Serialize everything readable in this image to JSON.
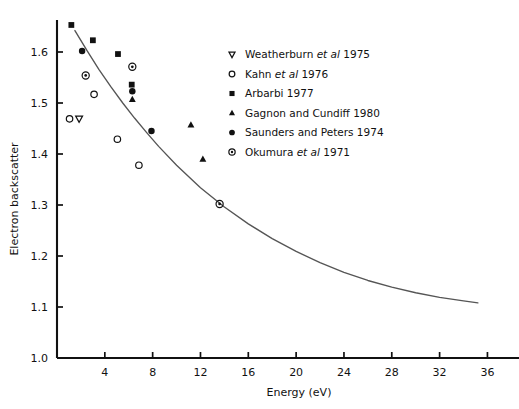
{
  "chart_data": {
    "type": "scatter",
    "title": "",
    "xlabel": "Energy (eV)",
    "ylabel": "Electron backscatter",
    "xlim": [
      0,
      36.8
    ],
    "ylim": [
      1.0,
      1.675
    ],
    "xticks": [
      4,
      8,
      12,
      16,
      20,
      24,
      28,
      32,
      36
    ],
    "yticks": [
      "1.0",
      "1.1",
      "1.2",
      "1.3",
      "1.4",
      "1.5",
      "1.6"
    ],
    "ytick_values": [
      1.0,
      1.1,
      1.2,
      1.3,
      1.4,
      1.5,
      1.6
    ],
    "grid": false,
    "legend_position": "upper-right-inside",
    "series": [
      {
        "name": "Weatherburn et al 1975",
        "marker": "triangle-down-open",
        "year": "1975",
        "points": [
          [
            1.85,
            1.469
          ]
        ]
      },
      {
        "name": "Kahn et al 1976",
        "marker": "circle-open",
        "year": "1976",
        "points": [
          [
            1.05,
            1.469
          ],
          [
            3.1,
            1.517
          ],
          [
            5.05,
            1.429
          ],
          [
            6.85,
            1.378
          ]
        ]
      },
      {
        "name": "Arbarbi 1977",
        "marker": "square-filled",
        "year": "1977",
        "points": [
          [
            1.2,
            1.653
          ],
          [
            3.0,
            1.623
          ],
          [
            5.1,
            1.596
          ],
          [
            6.25,
            1.536
          ]
        ]
      },
      {
        "name": "Gagnon and Cundiff 1980",
        "marker": "triangle-up-filled",
        "year": "1980",
        "points": [
          [
            6.3,
            1.507
          ],
          [
            11.2,
            1.457
          ],
          [
            12.2,
            1.39
          ]
        ]
      },
      {
        "name": "Saunders and Peters 1974",
        "marker": "circle-filled",
        "year": "1974",
        "points": [
          [
            2.1,
            1.602
          ],
          [
            6.3,
            1.523
          ],
          [
            7.9,
            1.445
          ]
        ]
      },
      {
        "name": "Okumura et al 1971",
        "marker": "circle-dot",
        "year": "1971",
        "points": [
          [
            2.4,
            1.554
          ],
          [
            6.3,
            1.571
          ],
          [
            13.6,
            1.302
          ]
        ]
      }
    ],
    "fit_curve": {
      "name": "fitted decay curve",
      "points": [
        [
          1.5,
          1.642
        ],
        [
          2.5,
          1.603
        ],
        [
          3.5,
          1.566
        ],
        [
          4.5,
          1.532
        ],
        [
          5.5,
          1.5
        ],
        [
          6.5,
          1.47
        ],
        [
          7.5,
          1.442
        ],
        [
          8.5,
          1.415
        ],
        [
          10.0,
          1.378
        ],
        [
          12.0,
          1.334
        ],
        [
          14.0,
          1.296
        ],
        [
          16.0,
          1.263
        ],
        [
          18.0,
          1.234
        ],
        [
          20.0,
          1.209
        ],
        [
          22.0,
          1.187
        ],
        [
          24.0,
          1.168
        ],
        [
          26.0,
          1.152
        ],
        [
          28.0,
          1.139
        ],
        [
          30.0,
          1.128
        ],
        [
          32.0,
          1.119
        ],
        [
          34.0,
          1.112
        ],
        [
          35.2,
          1.108
        ]
      ]
    }
  },
  "axes": {
    "x_title": "Energy (eV)",
    "y_title": "Electron backscatter"
  },
  "legend": {
    "entries": [
      {
        "marker": "triangle-down-open",
        "author": "Weatherburn",
        "etal": "et al",
        "rest": "1975",
        "full": "Weatherburn et al 1975"
      },
      {
        "marker": "circle-open",
        "author": "Kahn",
        "etal": "et al",
        "rest": "1976",
        "full": "Kahn et al 1976"
      },
      {
        "marker": "square-filled",
        "author": "Arbarbi",
        "etal": "",
        "rest": "1977",
        "full": "Arbarbi 1977"
      },
      {
        "marker": "triangle-up-filled",
        "author": "Gagnon and Cundiff",
        "etal": "",
        "rest": "1980",
        "full": "Gagnon and Cundiff 1980"
      },
      {
        "marker": "circle-filled",
        "author": "Saunders and Peters",
        "etal": "",
        "rest": "1974",
        "full": "Saunders and Peters 1974"
      },
      {
        "marker": "circle-dot",
        "author": "Okumura",
        "etal": "et al",
        "rest": "1971",
        "full": "Okumura et al 1971"
      }
    ]
  },
  "style": {
    "ink": "#111111",
    "curve": "#555555",
    "background": "#ffffff"
  }
}
